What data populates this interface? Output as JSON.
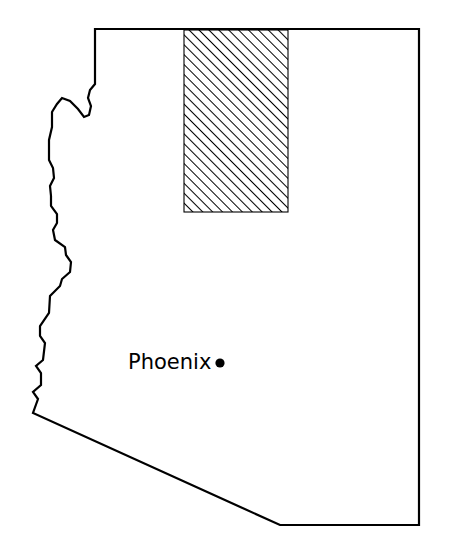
{
  "map": {
    "title": "Arizona state outline map",
    "region_name": "Arizona",
    "background_color": "#ffffff",
    "outline_color": "#000000",
    "outline_width": 2.2,
    "state_outline_path": "M 95,29 L 419,29 L 419,525 L 280,525 L 33,413 L 38,399 L 33,392 L 41,385 L 41,373 L 36,366 L 43,360 L 45,343 L 40,336 L 40,326 L 49,313 L 50,296 L 60,286 L 62,279 L 70,272 L 71,262 L 66,255 L 65,247 L 55,240 L 53,230 L 57,223 L 57,214 L 51,206 L 51,196 L 50,186 L 54,178 L 53,168 L 49,160 L 49,140 L 52,127 L 52,112 L 57,104 L 62,98 L 70,101 L 78,109 L 84,117 L 89,115 L 91,106 L 88,98 L 90,90 L 95,84 Z",
    "hatched_region": {
      "name": "hatched-study-area",
      "x": 184,
      "y": 30,
      "width": 104,
      "height": 182,
      "hatch_angle_deg": 45,
      "hatch_spacing": 7,
      "hatch_line_width": 2,
      "hatch_color": "#000000",
      "border_color": "#000000",
      "fill_color": "#ffffff"
    },
    "cities": [
      {
        "name": "Phoenix",
        "label": "Phoenix",
        "label_x": 128,
        "label_y": 369,
        "marker_x": 220,
        "marker_y": 363,
        "marker_radius": 4.6,
        "marker_color": "#000000"
      }
    ]
  }
}
